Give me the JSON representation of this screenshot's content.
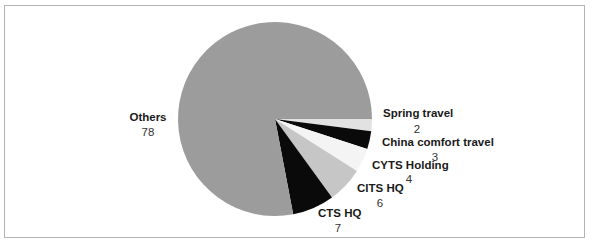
{
  "chart_data": {
    "type": "pie",
    "title": "",
    "start_angle_deg": 0,
    "direction": "clockwise",
    "categories": [
      "Spring travel",
      "China comfort travel",
      "CYTS Holding",
      "CITS HQ",
      "CTS HQ",
      "Others"
    ],
    "values": [
      2,
      3,
      4,
      6,
      7,
      78
    ],
    "colors": [
      "#e2e2e2",
      "#0a0a0a",
      "#f4f4f4",
      "#c6c6c6",
      "#0a0a0a",
      "#9c9c9c"
    ],
    "legend": "none (direct labels)"
  },
  "labels": [
    {
      "name": "Spring travel",
      "value": "2"
    },
    {
      "name": "China comfort travel",
      "value": "3"
    },
    {
      "name": "CYTS Holding",
      "value": "4"
    },
    {
      "name": "CITS HQ",
      "value": "6"
    },
    {
      "name": "CTS HQ",
      "value": "7"
    },
    {
      "name": "Others",
      "value": "78"
    }
  ]
}
